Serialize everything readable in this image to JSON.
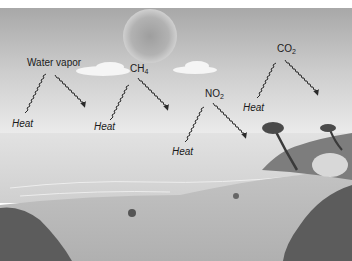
{
  "diagram": {
    "gases": [
      {
        "id": "water-vapor",
        "label": "Water vapor",
        "sub": "",
        "x": 27,
        "y": 58,
        "heat_x": 12,
        "heat_y": 119
      },
      {
        "id": "ch4",
        "label": "CH",
        "sub": "4",
        "x": 130,
        "y": 64,
        "heat_x": 94,
        "heat_y": 122
      },
      {
        "id": "no2",
        "label": "NO",
        "sub": "2",
        "x": 205,
        "y": 89,
        "heat_x": 172,
        "heat_y": 147
      },
      {
        "id": "co2",
        "label": "CO",
        "sub": "2",
        "x": 277,
        "y": 44,
        "heat_x": 243,
        "heat_y": 103
      }
    ],
    "heat_label": "Heat",
    "colors": {
      "sky_top": "#a9a9a9",
      "sky_bottom": "#e6e6e6",
      "sun": "#b4b4b4",
      "sea": "#d6d6d6",
      "sand": "#bdbdbd",
      "vegetation": "#5a5a5a",
      "arrow": "#2a2a2a",
      "text": "#1a1a1a"
    }
  }
}
